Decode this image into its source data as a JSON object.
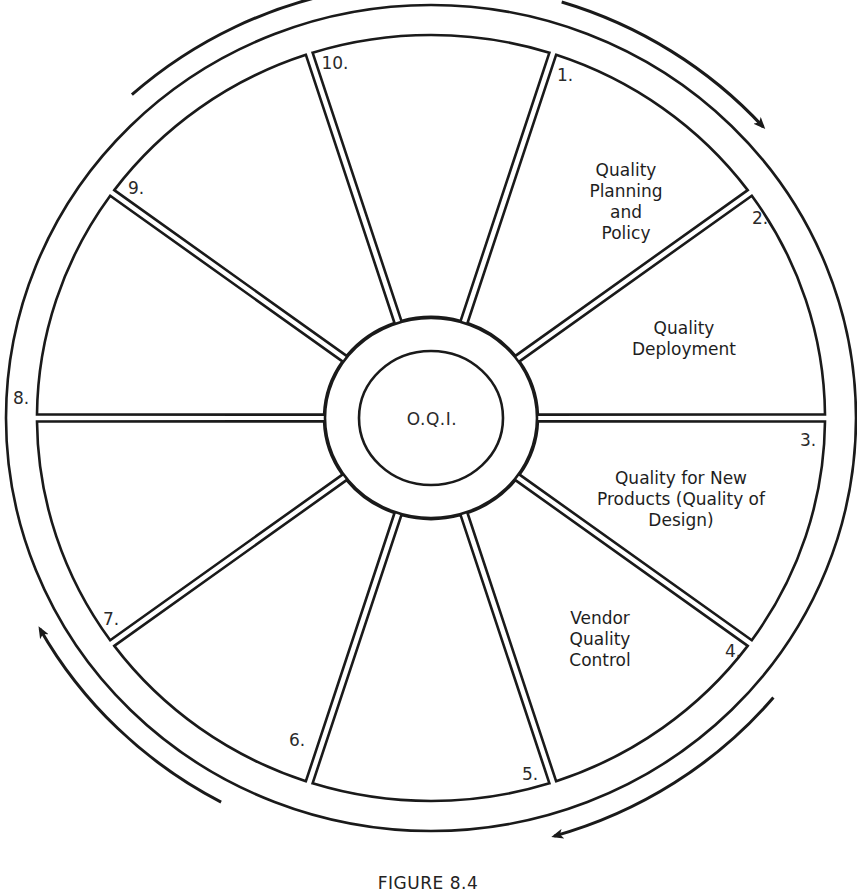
{
  "figure": {
    "caption": "FIGURE 8.4",
    "hub_label": "O.Q.I.",
    "stroke_color": "#1a1a1a",
    "background": "#ffffff"
  },
  "wheel": {
    "center": [
      431,
      418
    ],
    "outer_ring": {
      "rx": 425,
      "ry": 413
    },
    "rim": {
      "rx": 394,
      "ry": 383
    },
    "hub_outer": {
      "rx": 106,
      "ry": 100
    },
    "hub_inner": {
      "rx": 72,
      "ry": 67
    },
    "segment_count": 10,
    "spoke_gap": 7
  },
  "segments": [
    {
      "number": "1.",
      "num_pos": [
        565,
        75
      ],
      "lines": [
        "Quality",
        "Planning",
        "and",
        "Policy"
      ],
      "text_pos": [
        626,
        160
      ]
    },
    {
      "number": "2.",
      "num_pos": [
        760,
        218
      ],
      "lines": [
        "Quality",
        "Deployment"
      ],
      "text_pos": [
        684,
        318
      ]
    },
    {
      "number": "3.",
      "num_pos": [
        808,
        440
      ],
      "lines": [
        "Quality for New",
        "Products (Quality of",
        "Design)"
      ],
      "text_pos": [
        681,
        468
      ]
    },
    {
      "number": "4.",
      "num_pos": [
        733,
        651
      ],
      "lines": [
        "Vendor",
        "Quality",
        "Control"
      ],
      "text_pos": [
        600,
        608
      ]
    },
    {
      "number": "5.",
      "num_pos": [
        530,
        774
      ],
      "lines": [],
      "text_pos": [
        0,
        0
      ]
    },
    {
      "number": "6.",
      "num_pos": [
        297,
        740
      ],
      "lines": [],
      "text_pos": [
        0,
        0
      ]
    },
    {
      "number": "7.",
      "num_pos": [
        111,
        619
      ],
      "lines": [],
      "text_pos": [
        0,
        0
      ]
    },
    {
      "number": "8.",
      "num_pos": [
        21,
        398
      ],
      "lines": [],
      "text_pos": [
        0,
        0
      ]
    },
    {
      "number": "9.",
      "num_pos": [
        136,
        188
      ],
      "lines": [],
      "text_pos": [
        0,
        0
      ]
    },
    {
      "number": "10.",
      "num_pos": [
        335,
        63
      ],
      "lines": [],
      "text_pos": [
        0,
        0
      ]
    }
  ],
  "arrows": [
    {
      "name": "arrow-top-left-clockwise",
      "start_deg": 228,
      "end_deg": 260,
      "r_offset": 22
    },
    {
      "name": "arrow-top-right-clockwise",
      "start_deg": 287,
      "end_deg": 318,
      "r_offset": 22
    },
    {
      "name": "arrow-bottom-right-clockwise",
      "start_deg": 40,
      "end_deg": 74,
      "r_offset": 22
    },
    {
      "name": "arrow-bottom-left-clockwise",
      "start_deg": 118,
      "end_deg": 151,
      "r_offset": 22
    }
  ]
}
